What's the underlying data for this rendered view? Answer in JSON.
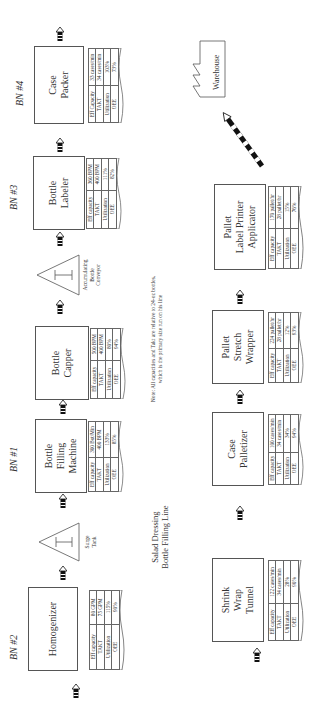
{
  "title": "Salad Dressing\nBottle Filling Line",
  "note": "Note: All capacities and Takt are relative to 24-oz bottles,\nwhich is the primary size run on his line",
  "row_labels": [
    "Eff capacity",
    "TAKT",
    "Utilization",
    "OEE"
  ],
  "top_row": [
    {
      "id": "homogenizer",
      "name": "Homogenizer",
      "bn": "BN #2",
      "eff_label": "Eff capacity",
      "eff": "80 GPM",
      "takt": "75 GPM",
      "util": "115%",
      "oee": "90%"
    },
    {
      "id": "surge-tank",
      "type": "inventory",
      "label": "Surge\nTank"
    },
    {
      "id": "bottle-filling",
      "name": "Bottle\nFilling\nMachine",
      "bn": "BN #1",
      "eff_label": "Eff capacity",
      "eff": "300 Bot/Min",
      "takt": "400 BPM",
      "util": "133%",
      "oee": "85%"
    },
    {
      "id": "bottle-capper",
      "name": "Bottle\nCapper",
      "bn": "",
      "eff_label": "Eff capacity",
      "eff": "500 BPM",
      "takt": "400 BPM",
      "util": "80%",
      "oee": "94%"
    },
    {
      "id": "accumulating-conveyor",
      "type": "inventory",
      "label": "Accumulating\nBottle\nConveyor"
    },
    {
      "id": "bottle-labeler",
      "name": "Bottle\nLabeler",
      "bn": "BN #3",
      "eff_label": "Eff capacity",
      "eff": "360 BPM",
      "takt": "400 BPM",
      "util": "111%",
      "oee": "82%"
    },
    {
      "id": "case-packer",
      "name": "Case\nPacker",
      "bn": "BN #4",
      "eff_label": "Eff Capacity",
      "eff": "33 cases/min",
      "takt": "34 cases/min",
      "util": "103%",
      "oee": "73%"
    }
  ],
  "bottom_row": [
    {
      "id": "shrink-wrap",
      "name": "Shrink\nWrap\nTunnel",
      "eff_label": "Eff capacity",
      "eff": "122 cases/min",
      "takt": "34 cases/min",
      "util": "28%",
      "oee": "90%"
    },
    {
      "id": "case-palletizer",
      "name": "Case\nPalletizer",
      "eff_label": "Eff capacity",
      "eff": "100 cases/min",
      "takt": "34 cases/min",
      "util": "34%",
      "oee": "94%"
    },
    {
      "id": "pallet-stretch-wrapper",
      "name": "Pallet\nStretch\nWrapper",
      "eff_label": "Eff capacity",
      "eff": "224 pallet/hr",
      "takt": "28 pallet/hr",
      "util": "12%",
      "oee": "93%"
    },
    {
      "id": "pallet-label-printer",
      "name": "Pallet\nLabel Printer\nApplicator",
      "eff_label": "Eff capacity",
      "eff": "170 pallet/hr",
      "takt": "28 pallet/hr",
      "util": "15%",
      "oee": "76%"
    }
  ],
  "warehouse": {
    "label": "Warehouse"
  },
  "colors": {
    "line": "#555555",
    "text": "#333333",
    "push": "#111111"
  }
}
